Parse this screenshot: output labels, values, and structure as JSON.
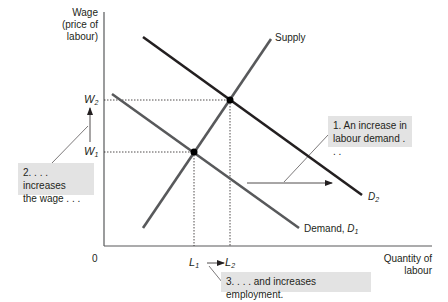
{
  "diagram": {
    "type": "supply-demand",
    "title": "",
    "y_axis": {
      "label_line1": "Wage",
      "label_line2": "(price of",
      "label_line3": "labour)"
    },
    "x_axis": {
      "label_line1": "Quantity of",
      "label_line2": "labour",
      "origin": "0"
    },
    "ticks": {
      "w2": {
        "base": "W",
        "sub": "2"
      },
      "w1": {
        "base": "W",
        "sub": "1"
      },
      "l1": {
        "base": "L",
        "sub": "1"
      },
      "l2": {
        "base": "L",
        "sub": "2"
      }
    },
    "curves": {
      "supply": {
        "label": "Supply",
        "color": "#58595b"
      },
      "demand1": {
        "label_prefix": "Demand, ",
        "base": "D",
        "sub": "1",
        "color": "#58595b"
      },
      "demand2": {
        "base": "D",
        "sub": "2",
        "color": "#231f20"
      }
    },
    "annotations": {
      "box1_line1": "1. An increase in",
      "box1_line2": "labour demand . . .",
      "box2_line1": "2. . . . increases",
      "box2_line2": "the wage . . .",
      "box3": "3. . . . and increases employment."
    },
    "colors": {
      "box_fill": "#e3e3e3",
      "axis": "#58595b",
      "text": "#231f20"
    }
  }
}
